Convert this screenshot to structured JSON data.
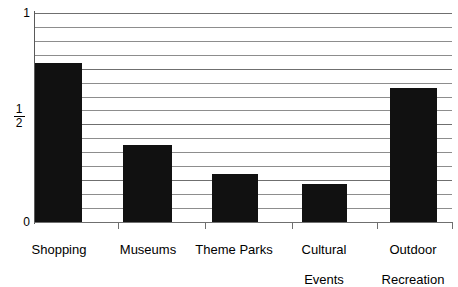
{
  "chart_data": {
    "type": "bar",
    "title": "",
    "subtitle": "",
    "xlabel": "",
    "ylabel": "",
    "categories": [
      "Shopping",
      "Museums",
      "Theme Parks",
      "Cultural Events",
      "Outdoor Recreation"
    ],
    "values": [
      0.76,
      0.37,
      0.23,
      0.18,
      0.64
    ],
    "ylim": [
      0,
      1
    ],
    "yticks": [
      0,
      0.5,
      1
    ],
    "ytick_labels": [
      "0",
      "1/2",
      "1"
    ],
    "grid": true,
    "gridlines": 16,
    "legend": "none",
    "bar_color": "#111111",
    "grid_color": "#8d8d8d",
    "axis_color": "#6f6f6f",
    "background": "#ffffff"
  },
  "axes": {
    "y": {
      "top_label": "1",
      "mid_label_numerator": "1",
      "mid_label_denominator": "2",
      "bottom_label": "0"
    },
    "x": {
      "labels": [
        {
          "line1": "Shopping",
          "line2": ""
        },
        {
          "line1": "Museums",
          "line2": ""
        },
        {
          "line1": "Theme Parks",
          "line2": ""
        },
        {
          "line1": "Cultural",
          "line2": "Events"
        },
        {
          "line1": "Outdoor",
          "line2": "Recreation"
        }
      ]
    }
  }
}
